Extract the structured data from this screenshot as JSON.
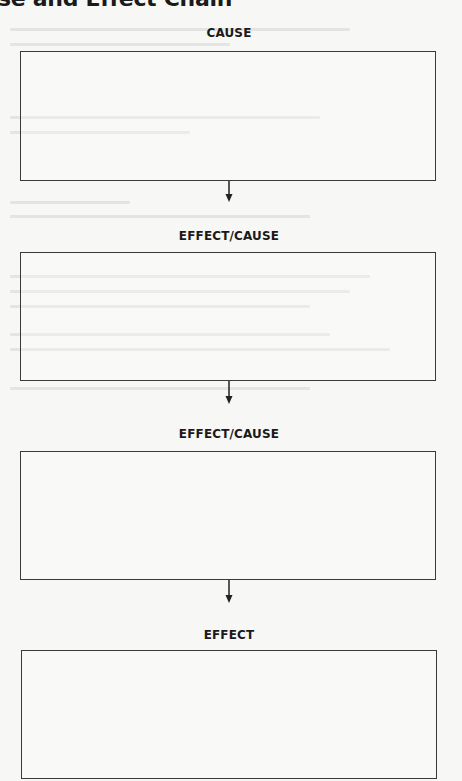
{
  "title": "se and Effect Chain",
  "chain": [
    {
      "label": "CAUSE",
      "response": ""
    },
    {
      "label": "EFFECT/CAUSE",
      "response": ""
    },
    {
      "label": "EFFECT/CAUSE",
      "response": ""
    },
    {
      "label": "EFFECT",
      "response": ""
    }
  ],
  "colors": {
    "line": "#3a3a3a",
    "paper": "#f7f7f5"
  }
}
